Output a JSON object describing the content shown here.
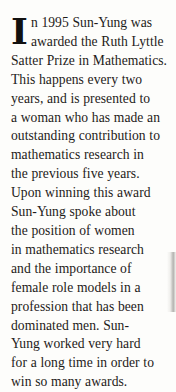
{
  "page": {
    "background_color": "#fdfdfb",
    "text_color": "#1d1b19",
    "edge_shadow_color": "#787672"
  },
  "passage": {
    "drop_cap": "I",
    "full_text": "In 1995 Sun-Yung was awarded the Ruth Lyttle Satter Prize in Mathematics. This happens every two years, and is presented to a woman who has made an outstanding contribution to mathematics research in the previous five years. Upon winning this award Sun-Yung spoke about the position of women in mathematics research and the importance of female role models in a profession that has been dominated men. Sun-Yung worked very hard for a long time in order to win so many awards.",
    "lines": [
      "n 1995 Sun-Yung was",
      "awarded the Ruth Lyttle",
      "Satter Prize in Mathematics.",
      "This happens every two",
      "years, and is presented to",
      "a woman who has made an",
      "outstanding contribution to",
      "mathematics research in",
      "the previous five years.",
      "Upon winning this award",
      "Sun-Yung spoke about",
      "the position of women",
      "in mathematics research",
      "and the importance of",
      "female role models in a",
      "profession that has been",
      "dominated men. Sun-",
      "Yung worked very hard",
      "for a long time in order to",
      "win so many awards."
    ]
  }
}
